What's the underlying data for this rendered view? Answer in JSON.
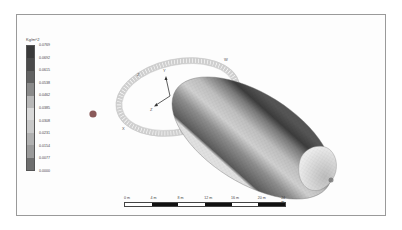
{
  "legend": {
    "title": "Kg/m^2",
    "values": [
      "0.0769",
      "0.0692",
      "0.0615",
      "0.0538",
      "0.0462",
      "0.0385",
      "0.0308",
      "0.0231",
      "0.0154",
      "0.0077",
      "0.0000"
    ],
    "colors": [
      "#3a3a3a",
      "#4a4a4a",
      "#626262",
      "#8a8a8a",
      "#b8b8b8",
      "#d8d8d8",
      "#c8c8c8",
      "#b0b0b0",
      "#9a9a9a",
      "#6e6e6e",
      "#3c3c3c"
    ]
  },
  "axes": {
    "labels": [
      "Z",
      "W",
      "Y",
      "Z",
      "X"
    ]
  },
  "scale_bar": {
    "labels": [
      "0 m",
      "4 m",
      "8 m",
      "12 m",
      "16 m",
      "20 m",
      "24 m"
    ]
  },
  "colors": {
    "marker": "#8a5a5a",
    "ring": "#c9c9c9",
    "body_light": "#d6d6d6",
    "body_dark": "#4c4c4c"
  }
}
